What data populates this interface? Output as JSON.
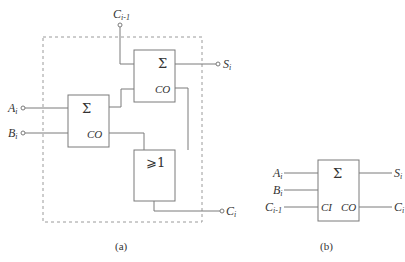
{
  "diagram_a": {
    "caption": "(a)",
    "inputs": {
      "a": {
        "base": "A",
        "sub": "i"
      },
      "b": {
        "base": "B",
        "sub": "i"
      },
      "cin": {
        "base": "C",
        "sub": "i-1"
      }
    },
    "outputs": {
      "s": {
        "base": "S",
        "sub": "i"
      },
      "cout": {
        "base": "C",
        "sub": "i"
      }
    },
    "half_adder_1": {
      "symbol": "Σ",
      "carry_label": "CO"
    },
    "half_adder_2": {
      "symbol": "Σ",
      "carry_label": "CO"
    },
    "or_gate": {
      "symbol": "⩾1"
    }
  },
  "diagram_b": {
    "caption": "(b)",
    "inputs": {
      "a": {
        "base": "A",
        "sub": "i"
      },
      "b": {
        "base": "B",
        "sub": "i"
      },
      "cin": {
        "base": "C",
        "sub": "i-1"
      }
    },
    "outputs": {
      "s": {
        "base": "S",
        "sub": "i"
      },
      "cout": {
        "base": "C",
        "sub": "i"
      }
    },
    "full_adder": {
      "symbol": "Σ",
      "carry_in_label": "CI",
      "carry_out_label": "CO"
    }
  }
}
